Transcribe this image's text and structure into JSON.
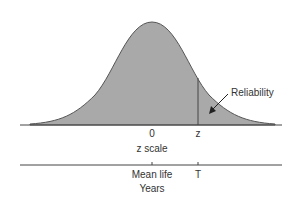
{
  "diagram": {
    "curve_label": "Reliability",
    "z_axis": {
      "zero_label": "0",
      "z_label": "z",
      "axis_title": "z scale"
    },
    "years_axis": {
      "mean_label": "Mean life",
      "t_label": "T",
      "axis_title": "Years"
    },
    "colors": {
      "fill": "#a9a9a9",
      "line": "#444444",
      "text": "#333333"
    }
  }
}
